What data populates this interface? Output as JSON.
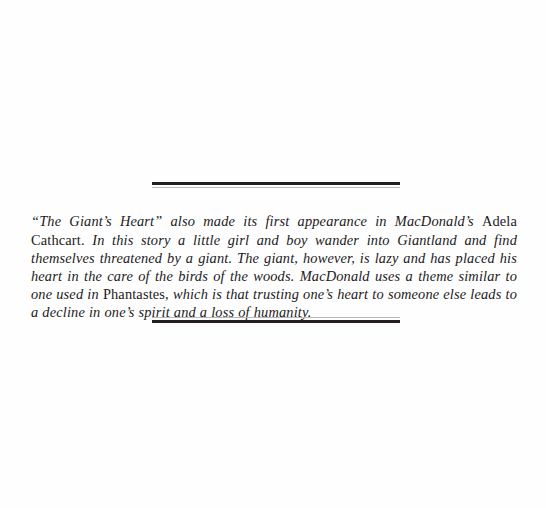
{
  "page": {
    "background_color": "#fefefe",
    "ink_color": "#231f20"
  },
  "ornament_top": {
    "name": "double-rule-ornament-top",
    "thick_color": "#231f20",
    "thin_color": "#b9b9bb"
  },
  "ornament_bottom": {
    "name": "double-rule-ornament-bottom",
    "thick_color": "#231f20",
    "thin_color": "#b9b9bb"
  },
  "excerpt": {
    "style": "italic",
    "full_text": "\"The Giant's Heart\" also made its first appearance in MacDonald's Adela Cathcart. In this story a little girl and boy wander into Giantland and find themselves threatened by a giant. The giant, however, is lazy and has placed his heart in the care of the birds of the woods. MacDonald uses a theme similar to one used in Phantastes, which is that trusting one's heart to someone else leads to a decline in one's spirit and a loss of humanity.",
    "segments": [
      {
        "text": "“The Giant’s Heart” also made its first appearance in MacDonald’s ",
        "roman": false
      },
      {
        "text": "Adela Cathcart.",
        "roman": true
      },
      {
        "text": " In this story a little girl and boy wander into Giantland and find themselves threatened by a giant. The giant, however, is lazy and has placed his heart in the care of the birds of the woods. MacDonald uses a theme similar to one used in ",
        "roman": false
      },
      {
        "text": "Phantastes,",
        "roman": true
      },
      {
        "text": " which is that trusting one’s heart to someone else leads to a decline in one’s spirit and a loss of humanity.",
        "roman": false
      }
    ],
    "lines": [
      "“The Giant’s Heart” also made its first appearance in MacDonald’s Adela Cathcart.",
      "In this story a little girl and boy wander into Giantland and find themselves threat-",
      "ened by a giant. The giant, however, is lazy and has placed his heart in the care of",
      "the birds of the woods. MacDonald uses a theme similar to one used in Phantastes,",
      "which is that trusting one’s heart to someone else leads to a decline in one’s spirit",
      "and a loss of humanity."
    ]
  }
}
